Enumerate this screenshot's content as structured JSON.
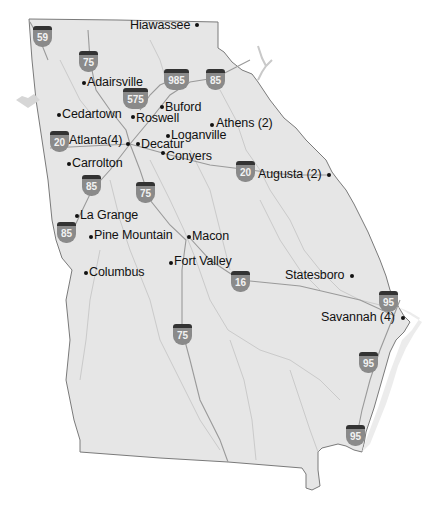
{
  "map": {
    "title": "Georgia",
    "colors": {
      "land": "#e6e6e6",
      "border": "#7a7a7a",
      "road": "#9a9a9a",
      "river": "#c9c9c9",
      "shield": "#8a8a8a",
      "shield_top": "#333333",
      "text": "#111111"
    },
    "cities": [
      {
        "name": "Hiawassee",
        "x": 197,
        "y": 25,
        "label_side": "left"
      },
      {
        "name": "Adairsville",
        "x": 84,
        "y": 83,
        "label_side": "right"
      },
      {
        "name": "Buford",
        "x": 162,
        "y": 107,
        "label_side": "right"
      },
      {
        "name": "Cedartown",
        "x": 59,
        "y": 115,
        "label_side": "right"
      },
      {
        "name": "Roswell",
        "x": 133,
        "y": 117,
        "label_side": "right"
      },
      {
        "name": "Athens (2)",
        "x": 212,
        "y": 125,
        "label_side": "right"
      },
      {
        "name": "Loganville",
        "x": 168,
        "y": 136,
        "label_side": "right"
      },
      {
        "name": "Atlanta(4)",
        "x": 128,
        "y": 144,
        "label_side": "left"
      },
      {
        "name": "Decatur",
        "x": 138,
        "y": 144,
        "label_side": "right"
      },
      {
        "name": "Conyers",
        "x": 163,
        "y": 153,
        "label_side": "right"
      },
      {
        "name": "Carrolton",
        "x": 69,
        "y": 163,
        "label_side": "right"
      },
      {
        "name": "Augusta (2)",
        "x": 329,
        "y": 175,
        "label_side": "left"
      },
      {
        "name": "La Grange",
        "x": 77,
        "y": 216,
        "label_side": "right"
      },
      {
        "name": "Pine Mountain",
        "x": 91,
        "y": 236,
        "label_side": "right"
      },
      {
        "name": "Macon",
        "x": 189,
        "y": 237,
        "label_side": "right"
      },
      {
        "name": "Fort Valley",
        "x": 171,
        "y": 262,
        "label_side": "right"
      },
      {
        "name": "Columbus",
        "x": 86,
        "y": 273,
        "label_side": "right"
      },
      {
        "name": "Statesboro",
        "x": 352,
        "y": 276,
        "label_side": "left"
      },
      {
        "name": "Savannah (4)",
        "x": 403,
        "y": 318,
        "label_side": "left"
      }
    ],
    "interstates": [
      {
        "number": "59",
        "x": 42,
        "y": 36
      },
      {
        "number": "75",
        "x": 88,
        "y": 61
      },
      {
        "number": "985",
        "x": 176,
        "y": 79
      },
      {
        "number": "85",
        "x": 215,
        "y": 79
      },
      {
        "number": "575",
        "x": 135,
        "y": 98
      },
      {
        "number": "20",
        "x": 59,
        "y": 141
      },
      {
        "number": "85",
        "x": 91,
        "y": 185
      },
      {
        "number": "75",
        "x": 145,
        "y": 192
      },
      {
        "number": "85",
        "x": 66,
        "y": 232
      },
      {
        "number": "20",
        "x": 245,
        "y": 171
      },
      {
        "number": "16",
        "x": 240,
        "y": 281
      },
      {
        "number": "95",
        "x": 388,
        "y": 301
      },
      {
        "number": "75",
        "x": 182,
        "y": 334
      },
      {
        "number": "95",
        "x": 368,
        "y": 362
      },
      {
        "number": "95",
        "x": 355,
        "y": 435
      }
    ]
  }
}
